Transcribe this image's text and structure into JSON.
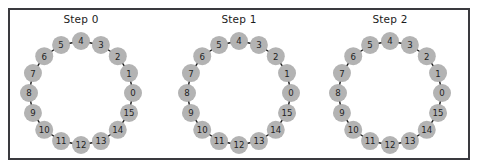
{
  "figure": {
    "width": 478,
    "height": 168,
    "background_color": "#ffffff",
    "frame_color": "#3a3a3f"
  },
  "panels": [
    {
      "title": "Step 0",
      "center_x": 81,
      "center_y": 93
    },
    {
      "title": "Step 1",
      "center_x": 239,
      "center_y": 93
    },
    {
      "title": "Step 2",
      "center_x": 390,
      "center_y": 93
    }
  ],
  "chart_data": {
    "type": "diagram",
    "subtype": "ring-graph-node-link",
    "title": "",
    "panel_titles": [
      "Step 0",
      "Step 1",
      "Step 2"
    ],
    "node_count": 16,
    "node_labels": [
      "0",
      "1",
      "2",
      "3",
      "4",
      "5",
      "6",
      "7",
      "8",
      "9",
      "10",
      "11",
      "12",
      "13",
      "14",
      "15"
    ],
    "layout": "circular",
    "radius": 52,
    "start_angle_deg": 0,
    "direction": "counterclockwise",
    "edges": [
      [
        0,
        1
      ],
      [
        1,
        2
      ],
      [
        2,
        3
      ],
      [
        3,
        4
      ],
      [
        4,
        5
      ],
      [
        5,
        6
      ],
      [
        6,
        7
      ],
      [
        7,
        8
      ],
      [
        8,
        9
      ],
      [
        9,
        10
      ],
      [
        10,
        11
      ],
      [
        11,
        12
      ],
      [
        12,
        13
      ],
      [
        13,
        14
      ],
      [
        14,
        15
      ],
      [
        15,
        0
      ]
    ],
    "node_fill_color": "#b3b3b3",
    "node_label_color": "#232323",
    "edge_color": "#1a1a1a",
    "node_radius": 9,
    "series": [
      {
        "name": "Step 0",
        "values": [
          0,
          1,
          2,
          3,
          4,
          5,
          6,
          7,
          8,
          9,
          10,
          11,
          12,
          13,
          14,
          15
        ]
      },
      {
        "name": "Step 1",
        "values": [
          0,
          1,
          2,
          3,
          4,
          5,
          6,
          7,
          8,
          9,
          10,
          11,
          12,
          13,
          14,
          15
        ]
      },
      {
        "name": "Step 2",
        "values": [
          0,
          1,
          2,
          3,
          4,
          5,
          6,
          7,
          8,
          9,
          10,
          11,
          12,
          13,
          14,
          15
        ]
      }
    ],
    "xlabel": "",
    "ylabel": "",
    "grid": false,
    "legend": "none"
  }
}
